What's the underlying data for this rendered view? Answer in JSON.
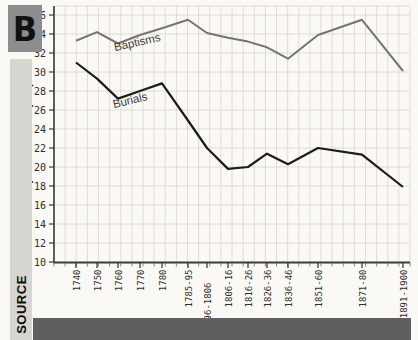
{
  "badge": {
    "label": "B",
    "bg": "#8d8d8d"
  },
  "source_bar": {
    "label": "SOURCE",
    "bg": "#d8d6d1"
  },
  "bottom_bar": {
    "bg": "#5f5f5f"
  },
  "chart_data": {
    "type": "line",
    "title": "",
    "xlabel": "",
    "ylabel": "per thousand people",
    "ylim": [
      10,
      36
    ],
    "ytick_step": 2,
    "grid": true,
    "legend_position": "inline-labels",
    "categories": [
      "1740",
      "1750",
      "1760",
      "1770",
      "1780",
      "1785-95",
      "1796-1806",
      "1806-16",
      "1816-26",
      "1826-36",
      "1836-46",
      "1851-60",
      "1871-80",
      "1891-1900"
    ],
    "series": [
      {
        "name": "Baptisms",
        "color": "#757575",
        "values": [
          33.3,
          34.2,
          33.0,
          33.9,
          34.6,
          35.5,
          34.1,
          33.6,
          33.2,
          32.6,
          31.4,
          33.9,
          35.5,
          30.1
        ]
      },
      {
        "name": "Burials",
        "color": "#1c1c1c",
        "values": [
          31.0,
          29.3,
          27.2,
          28.0,
          28.8,
          24.9,
          22.0,
          19.8,
          20.0,
          21.4,
          20.3,
          22.0,
          21.3,
          17.9
        ]
      }
    ]
  }
}
